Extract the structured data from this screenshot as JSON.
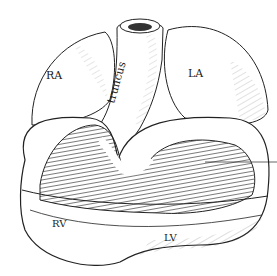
{
  "diagram": {
    "labels": {
      "ra": "RA",
      "la": "LA",
      "truncus": "truncus",
      "rv": "RV",
      "lv": "LV"
    }
  }
}
